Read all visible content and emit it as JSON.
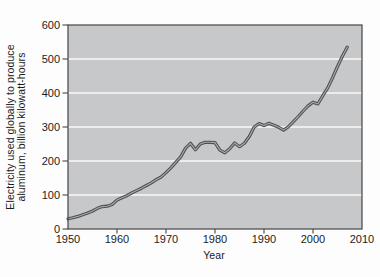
{
  "figure": {
    "xlabel": "Year",
    "ylabel_line1": "Electricity used globally to produce",
    "ylabel_line2": "aluminum, billion kilowatt-hours"
  },
  "colors": {
    "page_bg": "#fdfdfd",
    "plot_bg": "#c7c8ca",
    "gridline": "#fafafa",
    "frame": "#454547",
    "line_outer": "#505052",
    "line_highlight": "#a9aaac",
    "text": "#1b1b1b"
  },
  "chart_data": {
    "type": "line",
    "title": "",
    "xlabel": "Year",
    "ylabel": "Electricity used globally to produce aluminum, billion kilowatt-hours",
    "xlim": [
      1950,
      2010
    ],
    "ylim": [
      0,
      600
    ],
    "x_tick_labels": [
      1950,
      1960,
      1970,
      1980,
      1990,
      2000,
      2010
    ],
    "x_tick_marks": [
      1960,
      1970,
      1980,
      1990,
      2000
    ],
    "y_ticks": [
      0,
      100,
      200,
      300,
      400,
      500,
      600
    ],
    "gridlines_at": [
      100,
      200,
      300,
      400,
      500
    ],
    "grid": "horizontal",
    "legend": "none",
    "series": [
      {
        "name": "Electricity used to produce aluminum (billion kilowatt-hours)",
        "x": [
          1950,
          1951,
          1952,
          1953,
          1954,
          1955,
          1956,
          1957,
          1958,
          1959,
          1960,
          1961,
          1962,
          1963,
          1964,
          1965,
          1966,
          1967,
          1968,
          1969,
          1970,
          1971,
          1972,
          1973,
          1974,
          1975,
          1976,
          1977,
          1978,
          1979,
          1980,
          1981,
          1982,
          1983,
          1984,
          1985,
          1986,
          1987,
          1988,
          1989,
          1990,
          1991,
          1992,
          1993,
          1994,
          1995,
          1996,
          1997,
          1998,
          1999,
          2000,
          2001,
          2002,
          2003,
          2004,
          2005,
          2006,
          2007
        ],
        "y": [
          30,
          33,
          37,
          42,
          47,
          53,
          61,
          66,
          67,
          72,
          85,
          92,
          98,
          106,
          113,
          120,
          128,
          136,
          145,
          153,
          166,
          180,
          196,
          212,
          238,
          252,
          233,
          250,
          255,
          255,
          254,
          232,
          224,
          236,
          253,
          242,
          252,
          272,
          300,
          310,
          304,
          311,
          305,
          299,
          291,
          301,
          316,
          331,
          347,
          362,
          373,
          368,
          392,
          415,
          445,
          478,
          508,
          535
        ]
      }
    ]
  }
}
